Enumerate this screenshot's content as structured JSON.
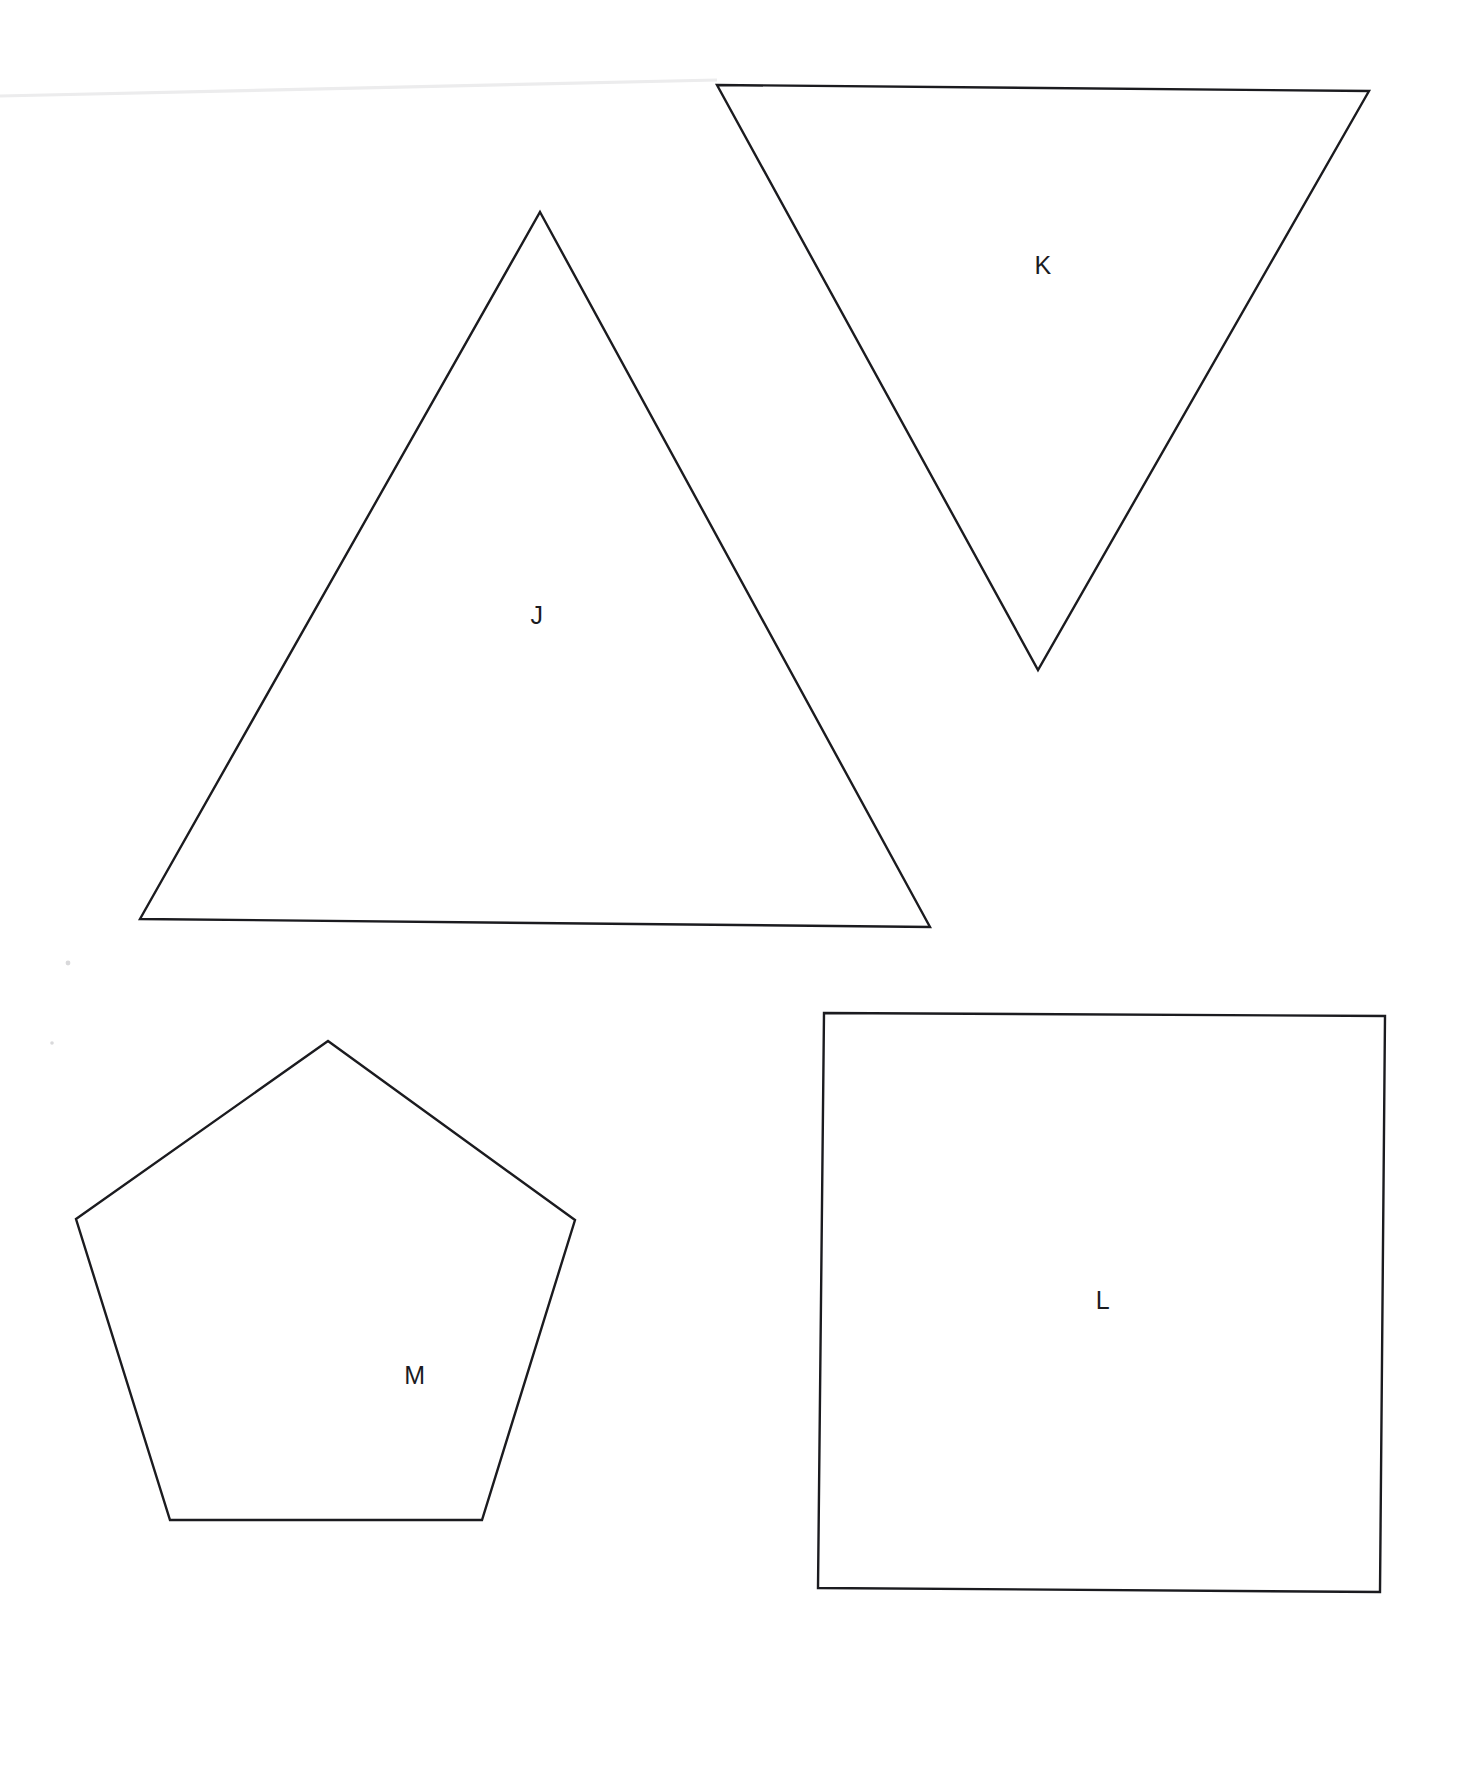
{
  "page": {
    "background_color": "#ffffff",
    "width": 1461,
    "height": 1773,
    "ink_color": "#1b1b1f",
    "scan_artifact_color": "#ececed"
  },
  "shapes": [
    {
      "id": "shape-j",
      "label": "J",
      "kind": "triangle",
      "description": "upright acute triangle",
      "label_x": 537,
      "label_y": 615,
      "points": "540,212 930,927 140,919"
    },
    {
      "id": "shape-k",
      "label": "K",
      "kind": "triangle",
      "description": "inverted triangle",
      "label_x": 1043,
      "label_y": 265,
      "points": "717,85 1369,91 1038,670"
    },
    {
      "id": "shape-l",
      "label": "L",
      "kind": "square",
      "description": "square",
      "label_x": 1103,
      "label_y": 1300,
      "points": "824,1013 1385,1016 1380,1592 818,1588"
    },
    {
      "id": "shape-m",
      "label": "M",
      "kind": "pentagon",
      "description": "regular pentagon",
      "label_x": 415,
      "label_y": 1375,
      "points": "328,1041 575,1220 482,1520 170,1520 76,1219"
    }
  ],
  "artifacts": {
    "top_scan_line": "0,96 717,80",
    "specks": [
      {
        "cx": 752,
        "cy": 660,
        "r": 2.0
      },
      {
        "cx": 68,
        "cy": 963,
        "r": 2.4
      },
      {
        "cx": 52,
        "cy": 1043,
        "r": 1.8
      }
    ]
  }
}
